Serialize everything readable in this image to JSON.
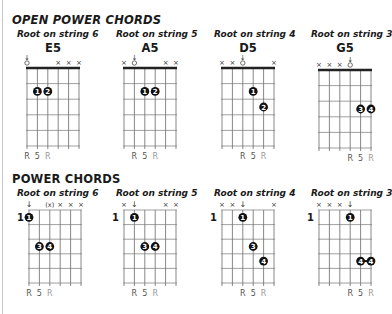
{
  "sections": [
    {
      "title": "OPEN POWER CHORDS",
      "chords": [
        {
          "subtitle": "Root on string 6",
          "name": "E5",
          "start_fret_label": "",
          "string_marks": [
            "open-root",
            "",
            "",
            "x",
            "x",
            "x"
          ],
          "dots": [
            {
              "string": 5,
              "fret": 2,
              "finger": "1"
            },
            {
              "string": 4,
              "fret": 2,
              "finger": "2"
            }
          ],
          "interval_labels": [
            {
              "string": 6,
              "text": "R",
              "color": "#555555"
            },
            {
              "string": 5,
              "text": "5",
              "color": "#555555"
            },
            {
              "string": 4,
              "text": "R",
              "color": "#999999"
            }
          ]
        },
        {
          "subtitle": "Root on string 5",
          "name": "A5",
          "start_fret_label": "",
          "string_marks": [
            "x",
            "open-root",
            "",
            "",
            "x",
            "x"
          ],
          "dots": [
            {
              "string": 4,
              "fret": 2,
              "finger": "1"
            },
            {
              "string": 3,
              "fret": 2,
              "finger": "2"
            }
          ],
          "interval_labels": [
            {
              "string": 5,
              "text": "R",
              "color": "#555555"
            },
            {
              "string": 4,
              "text": "5",
              "color": "#555555"
            },
            {
              "string": 3,
              "text": "R",
              "color": "#999999"
            }
          ]
        },
        {
          "subtitle": "Root on string 4",
          "name": "D5",
          "start_fret_label": "",
          "string_marks": [
            "x",
            "x",
            "open-root",
            "",
            "",
            "x"
          ],
          "dots": [
            {
              "string": 3,
              "fret": 2,
              "finger": "1"
            },
            {
              "string": 2,
              "fret": 3,
              "finger": "2"
            }
          ],
          "interval_labels": [
            {
              "string": 4,
              "text": "R",
              "color": "#555555"
            },
            {
              "string": 3,
              "text": "5",
              "color": "#555555"
            },
            {
              "string": 2,
              "text": "R",
              "color": "#999999"
            }
          ]
        },
        {
          "subtitle": "Root on string 3",
          "name": "G5",
          "start_fret_label": "",
          "string_marks": [
            "x",
            "x",
            "x",
            "open-root",
            "",
            ""
          ],
          "dots": [
            {
              "string": 2,
              "fret": 3,
              "finger": "3"
            },
            {
              "string": 1,
              "fret": 3,
              "finger": "4"
            }
          ],
          "interval_labels": [
            {
              "string": 3,
              "text": "R",
              "color": "#555555"
            },
            {
              "string": 2,
              "text": "5",
              "color": "#555555"
            },
            {
              "string": 1,
              "text": "R",
              "color": "#999999"
            }
          ]
        }
      ]
    },
    {
      "title": "POWER CHORDS",
      "chords": [
        {
          "subtitle": "Root on string 6",
          "name": "",
          "start_fret_label": "1",
          "string_marks": [
            "root",
            "",
            "(x)",
            "x",
            "x",
            "x"
          ],
          "dots": [
            {
              "string": 6,
              "fret": 1,
              "finger": "1"
            },
            {
              "string": 5,
              "fret": 3,
              "finger": "3"
            },
            {
              "string": 4,
              "fret": 3,
              "finger": "4"
            }
          ],
          "interval_labels": [
            {
              "string": 6,
              "text": "R",
              "color": "#555555"
            },
            {
              "string": 5,
              "text": "5",
              "color": "#555555"
            },
            {
              "string": 4,
              "text": "R",
              "color": "#999999"
            }
          ]
        },
        {
          "subtitle": "Root on string 5",
          "name": "",
          "start_fret_label": "1",
          "string_marks": [
            "x",
            "root",
            "",
            "",
            "x",
            "x"
          ],
          "dots": [
            {
              "string": 5,
              "fret": 1,
              "finger": "1"
            },
            {
              "string": 4,
              "fret": 3,
              "finger": "3"
            },
            {
              "string": 3,
              "fret": 3,
              "finger": "4"
            }
          ],
          "interval_labels": [
            {
              "string": 5,
              "text": "R",
              "color": "#555555"
            },
            {
              "string": 4,
              "text": "5",
              "color": "#555555"
            },
            {
              "string": 3,
              "text": "R",
              "color": "#999999"
            }
          ]
        },
        {
          "subtitle": "Root on string 4",
          "name": "",
          "start_fret_label": "1",
          "string_marks": [
            "x",
            "x",
            "root",
            "",
            "",
            "x"
          ],
          "dots": [
            {
              "string": 4,
              "fret": 1,
              "finger": "1"
            },
            {
              "string": 3,
              "fret": 3,
              "finger": "3"
            },
            {
              "string": 2,
              "fret": 4,
              "finger": "4"
            }
          ],
          "interval_labels": [
            {
              "string": 4,
              "text": "R",
              "color": "#555555"
            },
            {
              "string": 3,
              "text": "5",
              "color": "#555555"
            },
            {
              "string": 2,
              "text": "R",
              "color": "#999999"
            }
          ]
        },
        {
          "subtitle": "Root on string 3",
          "name": "",
          "start_fret_label": "1",
          "string_marks": [
            "x",
            "x",
            "x",
            "root",
            "",
            ""
          ],
          "dots": [
            {
              "string": 3,
              "fret": 1,
              "finger": "1"
            },
            {
              "string": 2,
              "fret": 4,
              "finger": "4"
            },
            {
              "string": 1,
              "fret": 4,
              "finger": "4"
            }
          ],
          "barre": {
            "from_string": 2,
            "to_string": 1,
            "fret": 4
          },
          "interval_labels": [
            {
              "string": 3,
              "text": "R",
              "color": "#555555"
            },
            {
              "string": 2,
              "text": "5",
              "color": "#555555"
            },
            {
              "string": 1,
              "text": "R",
              "color": "#999999"
            }
          ]
        }
      ]
    }
  ]
}
